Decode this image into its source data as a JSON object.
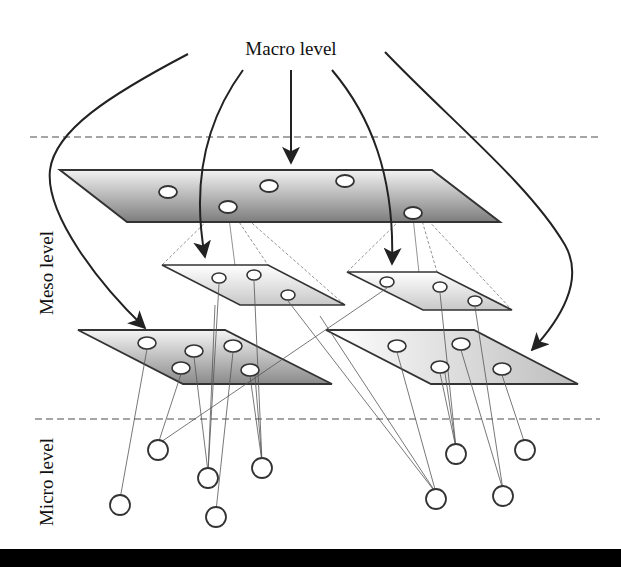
{
  "labels": {
    "macro": "Macro level",
    "meso": "Meso level",
    "micro": "Micro level"
  },
  "colors": {
    "plane_dark": "#8a8a8a",
    "plane_light": "#f0f0f0",
    "stroke": "#333333",
    "dashed": "#888888",
    "thin_line": "#555555",
    "footer": "#000000"
  },
  "planes": {
    "macro": {
      "points": "60,170 432,170 500,222 127,222",
      "nodes": [
        [
          168,
          192
        ],
        [
          269,
          186
        ],
        [
          345,
          181
        ],
        [
          228,
          207
        ],
        [
          413,
          213
        ]
      ]
    },
    "meso_top_left": {
      "points": "162,265 268,265 345,305 240,305",
      "nodes": [
        [
          219,
          278
        ],
        [
          254,
          275
        ],
        [
          288,
          295
        ]
      ]
    },
    "meso_top_right": {
      "points": "347,272 437,272 512,310 423,310",
      "nodes": [
        [
          387,
          282
        ],
        [
          440,
          287
        ],
        [
          475,
          301
        ]
      ]
    },
    "meso_bottom_left": {
      "points": "78,330 225,330 332,384 183,384",
      "nodes": [
        [
          147,
          343
        ],
        [
          194,
          351
        ],
        [
          233,
          346
        ],
        [
          181,
          368
        ],
        [
          250,
          370
        ]
      ]
    },
    "meso_bottom_right": {
      "points": "326,330 474,330 578,384 431,384",
      "nodes": [
        [
          397,
          346
        ],
        [
          461,
          344
        ],
        [
          440,
          367
        ],
        [
          502,
          369
        ]
      ]
    }
  },
  "micro_nodes": [
    [
      158,
      450
    ],
    [
      120,
      505
    ],
    [
      208,
      478
    ],
    [
      262,
      468
    ],
    [
      216,
      517
    ],
    [
      456,
      454
    ],
    [
      525,
      450
    ],
    [
      436,
      499
    ],
    [
      503,
      496
    ]
  ],
  "dividers": {
    "top_y": 137,
    "bottom_y": 419
  }
}
